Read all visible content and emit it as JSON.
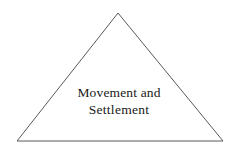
{
  "figure": {
    "background_color": "#ffffff",
    "shape": {
      "name": "triangle",
      "type": "isosceles-triangle",
      "stroke_color": "#595959",
      "stroke_width": 1,
      "fill": "none",
      "apex": {
        "x": 118,
        "y": 13
      },
      "bottom_left": {
        "x": 17,
        "y": 141
      },
      "bottom_right": {
        "x": 223,
        "y": 141
      },
      "points": "118,13 223,141 17,141"
    },
    "label": {
      "text_color": "#191919",
      "lines": [
        "Movement and",
        "Settlement"
      ]
    }
  }
}
